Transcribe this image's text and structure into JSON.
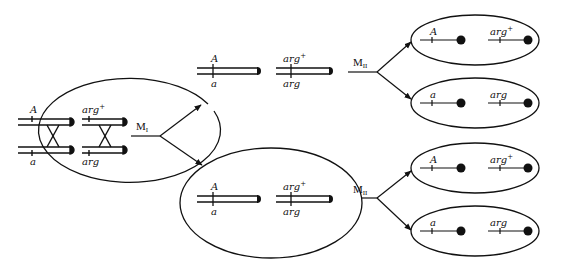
{
  "diagram": {
    "title": "",
    "stages": {
      "meiosis1": {
        "label": "M",
        "sub": "I"
      },
      "meiosis2_top": {
        "label": "M",
        "sub": "II"
      },
      "meiosis2_bottom": {
        "label": "M",
        "sub": "II"
      }
    },
    "parent": {
      "pair_A": {
        "top_label": "A",
        "bottom_label": "a"
      },
      "pair_arg": {
        "top_label": "arg",
        "top_sup": "+",
        "bottom_label": "arg"
      }
    },
    "meiosis1_products": [
      {
        "id": "cell-top",
        "chromosomes": [
          {
            "top_label": "A",
            "bottom_label": "a"
          },
          {
            "top_label": "arg",
            "top_sup": "+",
            "bottom_label": "arg"
          }
        ]
      },
      {
        "id": "cell-bottom",
        "chromosomes": [
          {
            "top_label": "A",
            "bottom_label": "a"
          },
          {
            "top_label": "arg",
            "top_sup": "+",
            "bottom_label": "arg"
          }
        ]
      }
    ],
    "meiosis2_products": [
      {
        "id": "gamete-1",
        "chromatids": [
          {
            "label": "A",
            "sup": ""
          },
          {
            "label": "arg",
            "sup": "+"
          }
        ]
      },
      {
        "id": "gamete-2",
        "chromatids": [
          {
            "label": "a",
            "sup": ""
          },
          {
            "label": "arg",
            "sup": ""
          }
        ]
      },
      {
        "id": "gamete-3",
        "chromatids": [
          {
            "label": "A",
            "sup": ""
          },
          {
            "label": "arg",
            "sup": "+"
          }
        ]
      },
      {
        "id": "gamete-4",
        "chromatids": [
          {
            "label": "a",
            "sup": ""
          },
          {
            "label": "arg",
            "sup": ""
          }
        ]
      }
    ],
    "colors": {
      "stroke": "#111111",
      "background": "#ffffff"
    }
  }
}
